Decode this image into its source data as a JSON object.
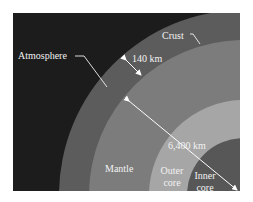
{
  "diagram": {
    "layers": [
      {
        "name": "Atmosphere",
        "color": "#5c5c5c"
      },
      {
        "name": "Crust",
        "color": "#6a6a6a"
      },
      {
        "name": "Mantle",
        "color": "#7c7c7c"
      },
      {
        "name": "Outer core",
        "color": "#a6a6a6"
      },
      {
        "name": "Inner core",
        "color": "#575757"
      }
    ],
    "background_color": "#1c1c1c",
    "labels": {
      "atmosphere": "Atmosphere",
      "crust": "Crust",
      "mantle": "Mantle",
      "outer_core_line1": "Outer",
      "outer_core_line2": "core",
      "inner_core_line1": "Inner",
      "inner_core_line2": "core"
    },
    "measurements": {
      "atmosphere_thickness": "140 km",
      "earth_radius": "6,400 km"
    }
  }
}
